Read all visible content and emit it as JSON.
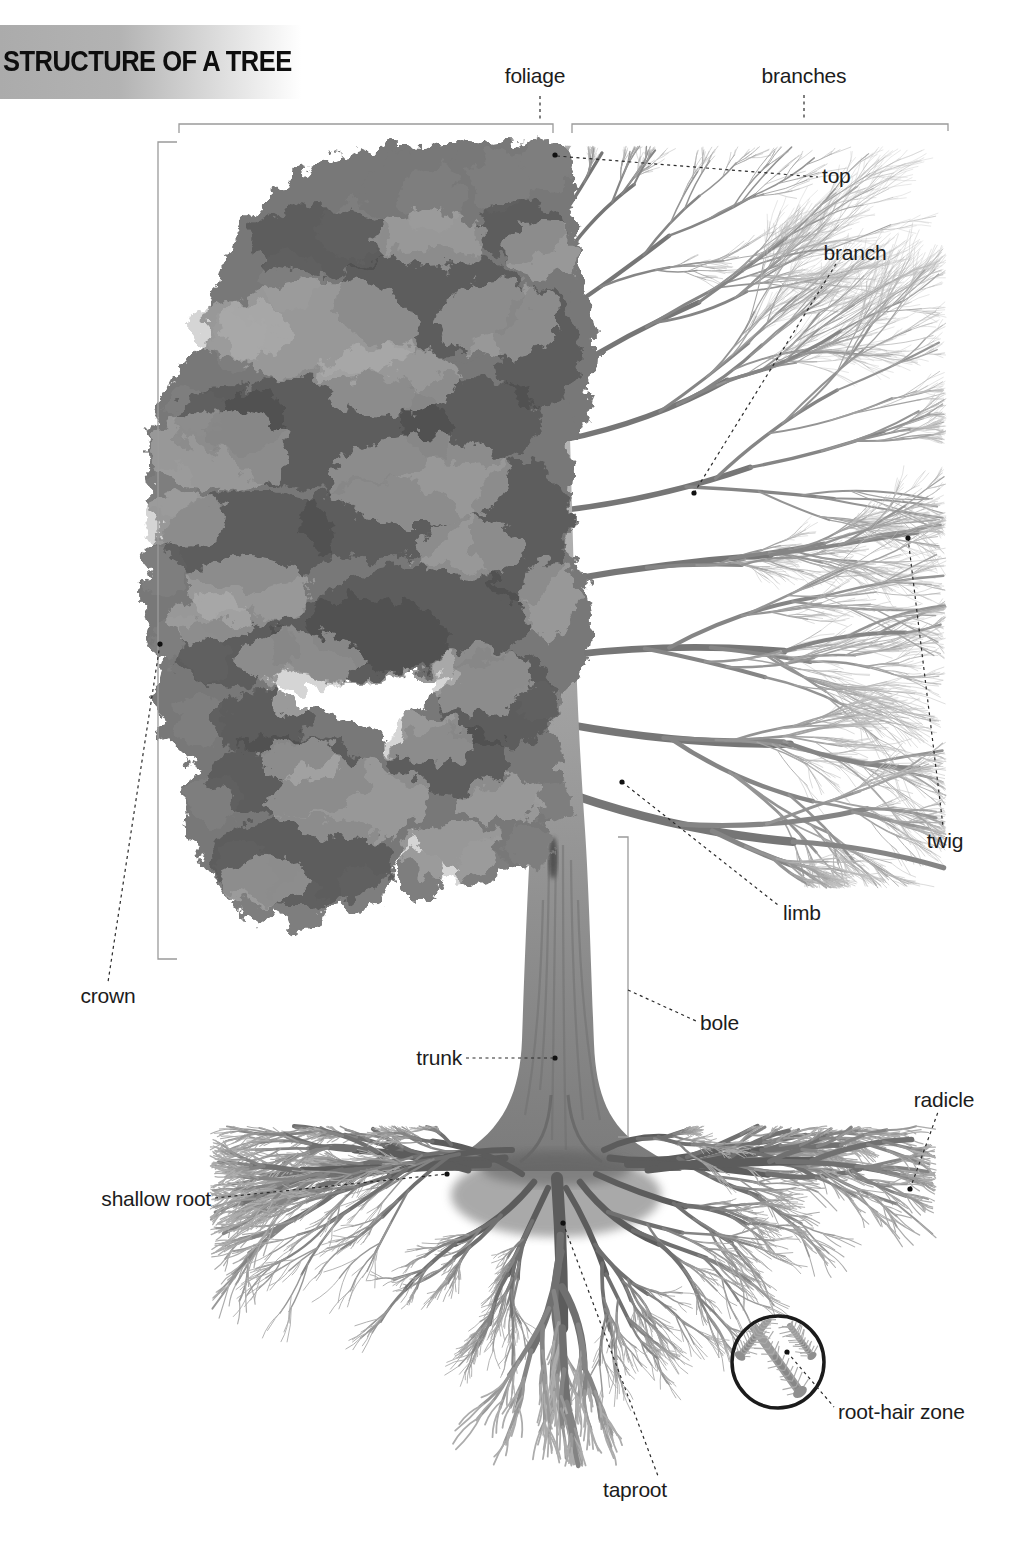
{
  "title": "STRUCTURE OF A TREE",
  "labels": {
    "foliage": "foliage",
    "branches": "branches",
    "top": "top",
    "branch": "branch",
    "twig": "twig",
    "limb": "limb",
    "crown": "crown",
    "bole": "bole",
    "trunk": "trunk",
    "shallow_root": "shallow root",
    "radicle": "radicle",
    "root_hair_zone": "root-hair zone",
    "taproot": "taproot"
  },
  "colors": {
    "background": "#ffffff",
    "title_text": "#0e0e0e",
    "title_band": "#b0b0b0",
    "label_text": "#1c1c1c",
    "leader_line": "#2a2a2a",
    "bracket_line": "#9b9b9b",
    "marker_dot": "#111111",
    "foliage_gray": "#787878",
    "trunk_gray": "#9a9a9a",
    "root_gray": "#9f9f9f",
    "inset_circle_stroke": "#1b1b1b"
  }
}
